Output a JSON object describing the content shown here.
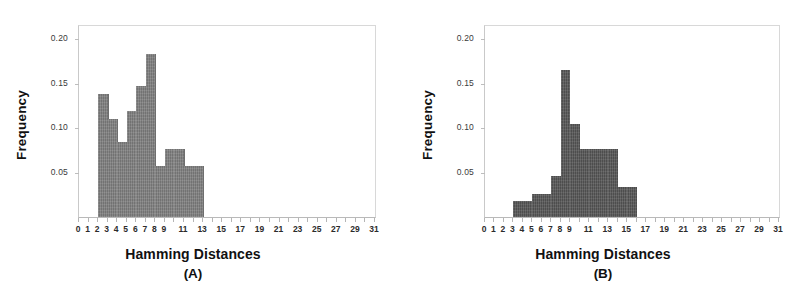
{
  "figure": {
    "panels": [
      "(A)",
      "(B)"
    ],
    "axis_title_x": "Hamming Distances",
    "axis_title_y": "Frequency",
    "y_tick_labels": [
      "0.20",
      "0.15",
      "0.10",
      "0.05"
    ],
    "x_tick_labels": [
      "0",
      "1",
      "2",
      "3",
      "4",
      "5",
      "6",
      "7",
      "8",
      "9",
      "11",
      "13",
      "15",
      "17",
      "19",
      "21",
      "23",
      "25",
      "27",
      "29",
      "31"
    ],
    "colors": {
      "bars_a": "#7d7d7d",
      "bars_b": "#565656",
      "frame": "#d8d8d8",
      "text": "#111111"
    }
  },
  "chart_data": [
    {
      "type": "bar",
      "title": "(A)",
      "xlabel": "Hamming Distances",
      "ylabel": "Frequency",
      "xlim": [
        0,
        31
      ],
      "ylim": [
        0,
        0.215
      ],
      "grid": false,
      "legend": "none",
      "bin_width": 1,
      "categories": [
        "2",
        "3",
        "4",
        "5",
        "6",
        "7",
        "8",
        "9",
        "10",
        "11",
        "12"
      ],
      "values": [
        0.139,
        0.11,
        0.084,
        0.119,
        0.147,
        0.184,
        0.057,
        0.076,
        0.076,
        0.057,
        0.057
      ],
      "x_ticks": [
        0,
        1,
        2,
        3,
        4,
        5,
        6,
        7,
        8,
        9,
        10,
        11,
        12,
        13,
        14,
        15,
        16,
        17,
        18,
        19,
        20,
        21,
        22,
        23,
        24,
        25,
        26,
        27,
        28,
        29,
        30,
        31
      ],
      "x_tick_labels_shown": [
        "0",
        "1",
        "2",
        "3",
        "4",
        "5",
        "6",
        "7",
        "8",
        "9",
        "11",
        "13",
        "15",
        "17",
        "19",
        "21",
        "23",
        "25",
        "27",
        "29",
        "31"
      ],
      "y_ticks": [
        0.05,
        0.1,
        0.15,
        0.2
      ],
      "color": "#7d7d7d"
    },
    {
      "type": "bar",
      "title": "(B)",
      "xlabel": "Hamming Distances",
      "ylabel": "Frequency",
      "xlim": [
        0,
        31
      ],
      "ylim": [
        0,
        0.215
      ],
      "grid": false,
      "legend": "none",
      "bin_width": 1,
      "categories": [
        "3",
        "4",
        "5",
        "6",
        "7",
        "8",
        "9",
        "10",
        "11",
        "12",
        "13",
        "14",
        "15"
      ],
      "values": [
        0.018,
        0.018,
        0.026,
        0.026,
        0.046,
        0.166,
        0.105,
        0.076,
        0.076,
        0.076,
        0.076,
        0.034,
        0.034
      ],
      "x_ticks": [
        0,
        1,
        2,
        3,
        4,
        5,
        6,
        7,
        8,
        9,
        10,
        11,
        12,
        13,
        14,
        15,
        16,
        17,
        18,
        19,
        20,
        21,
        22,
        23,
        24,
        25,
        26,
        27,
        28,
        29,
        30,
        31
      ],
      "x_tick_labels_shown": [
        "0",
        "1",
        "2",
        "3",
        "4",
        "5",
        "6",
        "7",
        "8",
        "9",
        "11",
        "13",
        "15",
        "17",
        "19",
        "21",
        "23",
        "25",
        "27",
        "29",
        "31"
      ],
      "y_ticks": [
        0.05,
        0.1,
        0.15,
        0.2
      ],
      "color": "#565656"
    }
  ]
}
